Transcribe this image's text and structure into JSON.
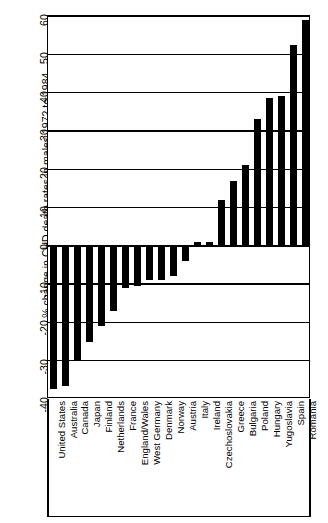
{
  "chart_data": {
    "type": "bar",
    "title": "",
    "subtitle": "",
    "orientation": "vertical",
    "xlabel": "",
    "ylabel": "% change in CHD death rates in males 1972 to 1984",
    "ylim": [
      -40,
      60
    ],
    "ytick_labels": [
      "60",
      "50",
      "40",
      "30",
      "20",
      "10",
      "0",
      "-10",
      "-20",
      "-30",
      "-40"
    ],
    "ytick_values": [
      60,
      50,
      40,
      30,
      20,
      10,
      0,
      -10,
      -20,
      -30,
      -40
    ],
    "grid": true,
    "grid_axis": "y",
    "legend": false,
    "legend_position": "none",
    "bar_color": "#000000",
    "background_color": "#ffffff",
    "categories": [
      "United States",
      "Australia",
      "Canada",
      "Japan",
      "Finland",
      "Netherlands",
      "France",
      "England/Wales",
      "West Germany",
      "Denmark",
      "Norway",
      "Austria",
      "Italy",
      "Ireland",
      "Czechoslovakia",
      "Greece",
      "Bulgaria",
      "Poland",
      "Hungary",
      "Yugoslavia",
      "Spain",
      "Romania"
    ],
    "values": [
      -37.5,
      -36.5,
      -30,
      -25,
      -21,
      -17,
      -11,
      -10.5,
      -9,
      -9,
      -8,
      -4,
      1,
      1,
      12,
      17,
      21,
      33,
      38.5,
      39,
      52.5,
      59
    ]
  }
}
